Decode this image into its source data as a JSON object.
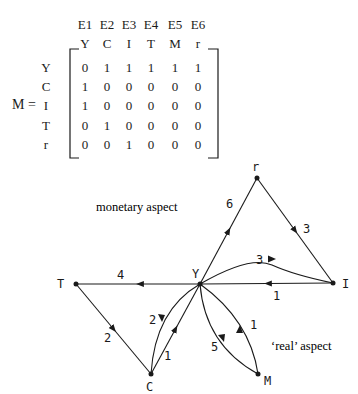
{
  "matrix": {
    "label": "M =",
    "edge_headers": [
      "E1",
      "E2",
      "E3",
      "E4",
      "E5",
      "E6"
    ],
    "col_headers": [
      "Y",
      "C",
      "I",
      "T",
      "M",
      "r"
    ],
    "row_headers": [
      "Y",
      "C",
      "I",
      "T",
      "r"
    ],
    "rows": [
      [
        "0",
        "1",
        "1",
        "1",
        "1",
        "1"
      ],
      [
        "1",
        "0",
        "0",
        "0",
        "0",
        "0"
      ],
      [
        "1",
        "0",
        "0",
        "0",
        "0",
        "0"
      ],
      [
        "0",
        "1",
        "0",
        "0",
        "0",
        "0"
      ],
      [
        "0",
        "0",
        "1",
        "0",
        "0",
        "0"
      ]
    ]
  },
  "graph": {
    "nodes": {
      "Y": {
        "label": "Y",
        "x": 200,
        "y": 284
      },
      "r": {
        "label": "r",
        "x": 257,
        "y": 178
      },
      "I": {
        "label": "I",
        "x": 333,
        "y": 283
      },
      "T": {
        "label": "T",
        "x": 76,
        "y": 284
      },
      "C": {
        "label": "C",
        "x": 151,
        "y": 374
      },
      "M": {
        "label": "M",
        "x": 258,
        "y": 374
      }
    },
    "edges": [
      {
        "from": "Y",
        "to": "r",
        "weight": "6"
      },
      {
        "from": "r",
        "to": "I",
        "weight": "3"
      },
      {
        "from": "Y",
        "to": "I",
        "weight": "3",
        "curved": true
      },
      {
        "from": "I",
        "to": "Y",
        "weight": "1"
      },
      {
        "from": "Y",
        "to": "T",
        "weight": "4"
      },
      {
        "from": "T",
        "to": "C",
        "weight": "2"
      },
      {
        "from": "Y",
        "to": "C",
        "weight": "2",
        "curved": true
      },
      {
        "from": "C",
        "to": "Y",
        "weight": "1"
      },
      {
        "from": "Y",
        "to": "M",
        "weight": "5",
        "curved": true
      },
      {
        "from": "M",
        "to": "Y",
        "weight": "1",
        "curved": true
      }
    ],
    "annotations": {
      "monetary": "monetary aspect",
      "real": "‘real’ aspect"
    }
  }
}
